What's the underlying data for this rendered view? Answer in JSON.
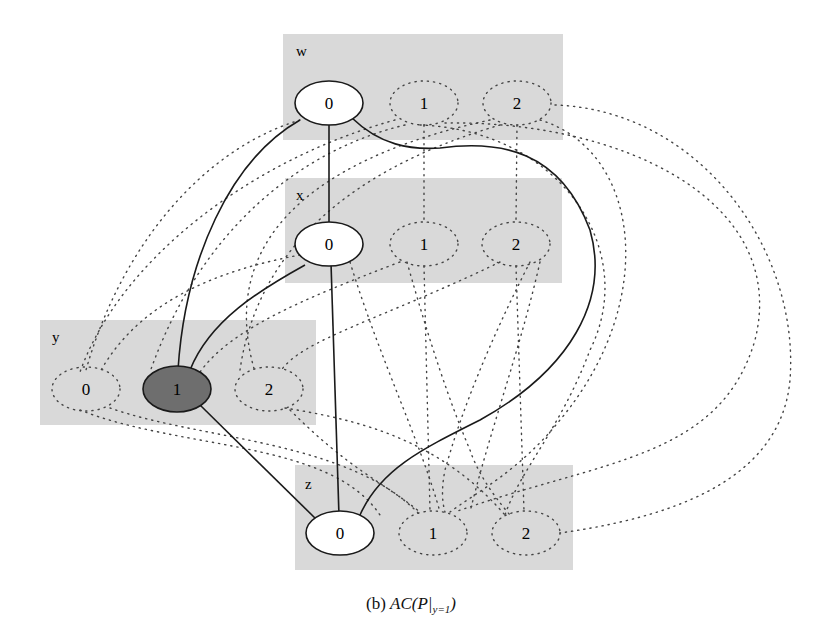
{
  "caption": {
    "label": "(b)",
    "math_main": "AC(P|",
    "math_sub": "y=1",
    "math_close": ")"
  },
  "colors": {
    "box_fill": "#d9d9d9",
    "node_fill": "#ffffff",
    "selected_fill": "#6e6e6e",
    "edge_solid": "#1a1a1a",
    "edge_dotted": "#444444"
  },
  "variables": [
    {
      "name": "w",
      "box": [
        283,
        34,
        280,
        106
      ],
      "label_pos": [
        296,
        56
      ],
      "values": [
        {
          "label": "0",
          "cx": 329,
          "cy": 103,
          "style": "solid"
        },
        {
          "label": "1",
          "cx": 424,
          "cy": 103,
          "style": "dotted"
        },
        {
          "label": "2",
          "cx": 517,
          "cy": 103,
          "style": "dotted"
        }
      ]
    },
    {
      "name": "x",
      "box": [
        285,
        178,
        277,
        105
      ],
      "label_pos": [
        296,
        200
      ],
      "values": [
        {
          "label": "0",
          "cx": 329,
          "cy": 244,
          "style": "solid"
        },
        {
          "label": "1",
          "cx": 424,
          "cy": 244,
          "style": "dotted"
        },
        {
          "label": "2",
          "cx": 516,
          "cy": 244,
          "style": "dotted"
        }
      ]
    },
    {
      "name": "y",
      "box": [
        40,
        320,
        276,
        105
      ],
      "label_pos": [
        52,
        342
      ],
      "values": [
        {
          "label": "0",
          "cx": 86,
          "cy": 389,
          "style": "dotted"
        },
        {
          "label": "1",
          "cx": 177,
          "cy": 389,
          "style": "selected"
        },
        {
          "label": "2",
          "cx": 269,
          "cy": 389,
          "style": "dotted"
        }
      ]
    },
    {
      "name": "z",
      "box": [
        295,
        465,
        278,
        105
      ],
      "label_pos": [
        305,
        489
      ],
      "values": [
        {
          "label": "0",
          "cx": 340,
          "cy": 533,
          "style": "solid"
        },
        {
          "label": "1",
          "cx": 433,
          "cy": 533,
          "style": "dotted"
        },
        {
          "label": "2",
          "cx": 526,
          "cy": 533,
          "style": "dotted"
        }
      ]
    }
  ],
  "solid_edges": [
    {
      "from": "w=0",
      "to": "x=0"
    },
    {
      "from": "w=0",
      "to": "y=1"
    },
    {
      "from": "w=0",
      "to": "z=0"
    },
    {
      "from": "x=0",
      "to": "y=1"
    },
    {
      "from": "x=0",
      "to": "z=0"
    },
    {
      "from": "y=1",
      "to": "z=0"
    }
  ]
}
